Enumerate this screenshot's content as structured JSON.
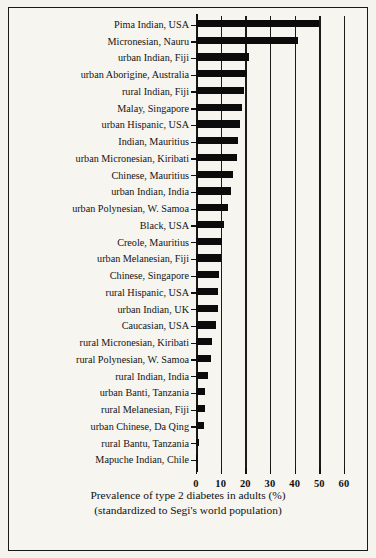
{
  "chart_data": {
    "type": "bar",
    "orientation": "horizontal",
    "title": "",
    "xlabel": "Prevalence of type 2 diabetes in adults (%)",
    "xlabel_line2": "(standardized to Segi's world population)",
    "ylabel": "",
    "xlim": [
      0,
      60
    ],
    "xticks": [
      0,
      10,
      20,
      30,
      40,
      50,
      60
    ],
    "grid": true,
    "grid_axis": "x",
    "legend": null,
    "bar_color": "#0b0b0b",
    "background_color": "#f6f5f0",
    "categories": [
      "Pima Indian, USA",
      "Micronesian, Nauru",
      "urban Indian, Fiji",
      "urban Aborigine, Australia",
      "rural Indian, Fiji",
      "Malay, Singapore",
      "urban Hispanic, USA",
      "Indian, Mauritius",
      "urban Micronesian, Kiribati",
      "Chinese, Mauritius",
      "urban Indian, India",
      "urban Polynesian, W. Samoa",
      "Black, USA",
      "Creole, Mauritius",
      "urban Melanesian, Fiji",
      "Chinese, Singapore",
      "rural Hispanic, USA",
      "urban Indian, UK",
      "Caucasian, USA",
      "rural Micronesian, Kiribati",
      "rural Polynesian, W. Samoa",
      "rural Indian, India",
      "urban Banti, Tanzania",
      "rural Melanesian, Fiji",
      "urban Chinese, Da Qing",
      "rural Bantu, Tanzania",
      "Mapuche Indian, Chile"
    ],
    "values": [
      50.0,
      41.5,
      21.5,
      20.5,
      19.5,
      18.5,
      18.0,
      17.0,
      16.5,
      15.0,
      14.0,
      13.0,
      11.5,
      10.5,
      10.0,
      9.5,
      9.0,
      8.8,
      8.0,
      6.5,
      6.0,
      5.0,
      3.5,
      3.5,
      3.2,
      1.2,
      1.0
    ],
    "value_unit": "%"
  },
  "axis": {
    "tick_labels": [
      "0",
      "10",
      "20",
      "30",
      "40",
      "50",
      "60"
    ]
  }
}
